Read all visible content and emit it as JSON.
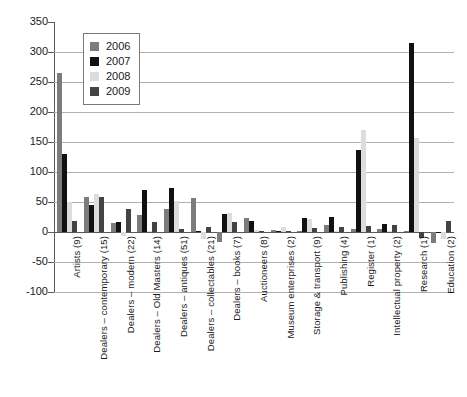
{
  "chart_data": {
    "type": "bar",
    "title": "",
    "subtitle": "",
    "xlabel": "",
    "ylabel": "",
    "ylim": [
      -100,
      350
    ],
    "ytick_step": 50,
    "yticks": [
      350,
      300,
      250,
      200,
      150,
      100,
      50,
      0,
      -50,
      -100
    ],
    "ytick_labels": [
      "350",
      "300",
      "250",
      "200",
      "150",
      "100",
      "50",
      "0",
      "-50",
      "-100"
    ],
    "grid": true,
    "grid_axis": "y",
    "legend_position": "upper-left-inside",
    "categories": [
      "Artists (9)",
      "Dealers – contemporary (15)",
      "Dealers – modern (22)",
      "Dealers – Old Masters (14)",
      "Dealers – antiques (51)",
      "Dealers – collectables (21)",
      "Dealers – books (7)",
      "Auctioneers (8)",
      "Museum enterprises (2)",
      "Storage & transport (9)",
      "Publishing (4)",
      "Register (1)",
      "Intellectual property (2)",
      "Research (1)",
      "Education (2)"
    ],
    "series": [
      {
        "name": "2006",
        "color": "#7c7c7c",
        "values": [
          265,
          58,
          15,
          28,
          38,
          56,
          -16,
          23,
          3,
          2,
          12,
          5,
          5,
          0,
          -18
        ]
      },
      {
        "name": "2007",
        "color": "#111111",
        "values": [
          130,
          45,
          17,
          70,
          73,
          2,
          30,
          18,
          1,
          23,
          25,
          137,
          13,
          315,
          -2
        ]
      },
      {
        "name": "2008",
        "color": "#dcdcdc",
        "values": [
          50,
          64,
          -6,
          2,
          52,
          -12,
          32,
          4,
          8,
          22,
          2,
          170,
          1,
          157,
          -12
        ]
      },
      {
        "name": "2009",
        "color": "#434343",
        "values": [
          18,
          58,
          38,
          16,
          5,
          9,
          16,
          1,
          1,
          7,
          9,
          10,
          12,
          -10,
          18
        ]
      }
    ]
  },
  "legend": {
    "items": [
      {
        "label": "2006",
        "color": "#7c7c7c"
      },
      {
        "label": "2007",
        "color": "#111111"
      },
      {
        "label": "2008",
        "color": "#dcdcdc"
      },
      {
        "label": "2009",
        "color": "#434343"
      }
    ]
  },
  "colors": {
    "axis": "#5a5a5a",
    "grid": "#b0b0b0",
    "background": "#ffffff",
    "text": "#1a1a1a"
  }
}
